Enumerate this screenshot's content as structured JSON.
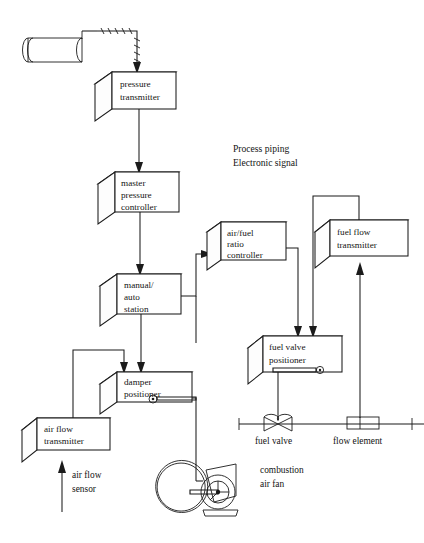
{
  "diagram": {
    "legend": {
      "line1": "Process piping",
      "line2": "Electronic signal"
    },
    "blocks": [
      {
        "id": "pressure-transmitter",
        "lines": [
          "pressure",
          "transmitter"
        ]
      },
      {
        "id": "master-pressure-controller",
        "lines": [
          "master",
          "pressure",
          "controller"
        ]
      },
      {
        "id": "manual-auto-station",
        "lines": [
          "manual/",
          "auto",
          "station"
        ]
      },
      {
        "id": "damper-positioner",
        "lines": [
          "damper",
          "positioner"
        ]
      },
      {
        "id": "air-flow-transmitter",
        "lines": [
          "air flow",
          "transmitter"
        ]
      },
      {
        "id": "air-fuel-ratio-controller",
        "lines": [
          "air/fuel",
          "ratio",
          "controller"
        ]
      },
      {
        "id": "fuel-flow-transmitter",
        "lines": [
          "fuel flow",
          "transmitter"
        ]
      },
      {
        "id": "fuel-valve-positioner",
        "lines": [
          "fuel valve",
          "positioner"
        ]
      }
    ],
    "annotations": [
      {
        "id": "air-flow-sensor",
        "lines": [
          "air flow",
          "sensor"
        ]
      },
      {
        "id": "combustion-air-fan",
        "lines": [
          "combustion",
          "air fan"
        ]
      },
      {
        "id": "fuel-valve",
        "lines": [
          "fuel valve"
        ]
      },
      {
        "id": "flow-element",
        "lines": [
          "flow element"
        ]
      }
    ],
    "symbols": [
      {
        "id": "steam-drum",
        "label": ""
      },
      {
        "id": "combustion-air-fan-symbol",
        "label": ""
      },
      {
        "id": "fuel-valve-symbol",
        "label": ""
      },
      {
        "id": "flow-element-symbol",
        "label": ""
      }
    ],
    "colors": {
      "background": "#ffffff",
      "ink": "#1b1b1b",
      "text": "#141414"
    }
  }
}
